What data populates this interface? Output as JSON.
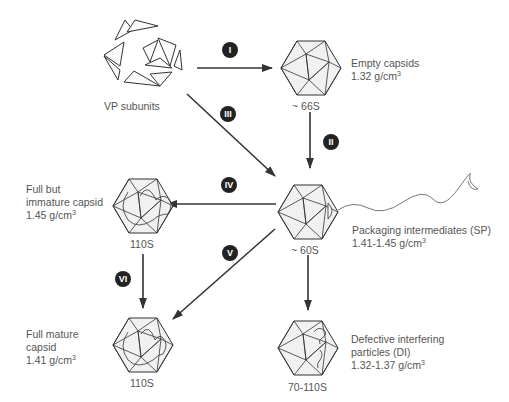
{
  "diagram": {
    "nodes": {
      "vp_subunits": {
        "label": "VP subunits"
      },
      "empty_capsid": {
        "sed": "~ 66S",
        "name": "Empty capsids",
        "density": "1.32 g/cm",
        "density_exp": "3"
      },
      "packaging": {
        "sed": "~ 60S",
        "name": "Packaging intermediates (SP)",
        "density": "1.41-1.45 g/cm",
        "density_exp": "3"
      },
      "immature": {
        "sed": "110S",
        "name_line1": "Full but",
        "name_line2": "immature capsid",
        "density": "1.45 g/cm",
        "density_exp": "3"
      },
      "mature": {
        "sed": "110S",
        "name_line1": "Full mature",
        "name_line2": "capsid",
        "density": "1.41 g/cm",
        "density_exp": "3"
      },
      "defective": {
        "sed": "70-110S",
        "name_line1": "Defective interfering",
        "name_line2": "particles (DI)",
        "density": "1.32-1.37 g/cm",
        "density_exp": "3"
      }
    },
    "steps": [
      {
        "id": "I",
        "label": "I",
        "from": "vp_subunits",
        "to": "empty_capsid"
      },
      {
        "id": "II",
        "label": "II",
        "from": "empty_capsid",
        "to": "packaging"
      },
      {
        "id": "III",
        "label": "III",
        "from": "vp_subunits",
        "to": "packaging"
      },
      {
        "id": "IV",
        "label": "IV",
        "from": "packaging",
        "to": "immature"
      },
      {
        "id": "V",
        "label": "V",
        "from": "packaging",
        "to": "mature"
      },
      {
        "id": "VI",
        "label": "VI",
        "from": "immature",
        "to": "mature"
      },
      {
        "id": "DI",
        "label": "",
        "from": "packaging",
        "to": "defective"
      }
    ],
    "colors": {
      "line": "#333333",
      "badge": "#222222",
      "badge_text": "#ffffff",
      "face": "#efefef",
      "text": "#555555"
    }
  }
}
